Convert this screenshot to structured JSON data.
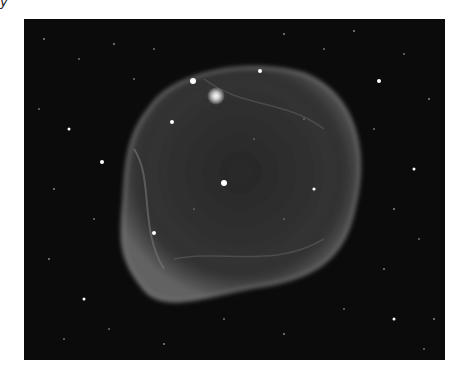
{
  "stray_text": "y",
  "image": {
    "subject": "nebula-bubble",
    "description": "Grayscale astronomical image of a large faint bubble-shaped nebula with filamentary shell against a dense star field",
    "colors": {
      "background": "#ffffff",
      "sky": "#0b0b0b",
      "nebula": "#9a9a9a",
      "stars": "#ffffff"
    }
  }
}
